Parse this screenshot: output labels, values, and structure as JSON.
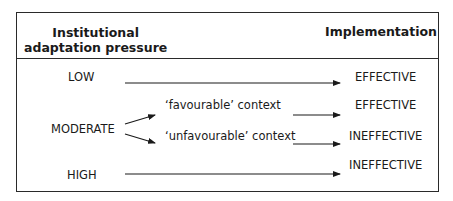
{
  "header": {
    "left_line1": "Institutional",
    "left_line2": "adaptation pressure",
    "right": "Implementation"
  },
  "rows": [
    {
      "pressure": "LOW",
      "outcome": "EFFECTIVE"
    },
    {
      "pressure": "MODERATE",
      "branches": [
        {
          "context": "‘favourable’ context",
          "outcome": "EFFECTIVE"
        },
        {
          "context": "‘unfavourable’ context",
          "outcome": "INEFFECTIVE"
        }
      ]
    },
    {
      "pressure": "HIGH",
      "outcome": "INEFFECTIVE"
    }
  ]
}
